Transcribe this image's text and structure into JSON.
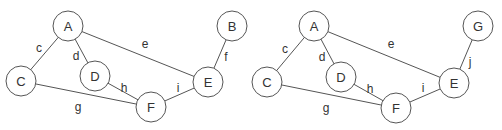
{
  "graphs": [
    {
      "id": "left",
      "nodes": [
        {
          "id": "A",
          "label": "A",
          "x": 68,
          "y": 26
        },
        {
          "id": "B",
          "label": "B",
          "x": 232,
          "y": 26
        },
        {
          "id": "C",
          "label": "C",
          "x": 21,
          "y": 81
        },
        {
          "id": "D",
          "label": "D",
          "x": 95,
          "y": 76
        },
        {
          "id": "E",
          "label": "E",
          "x": 208,
          "y": 82
        },
        {
          "id": "F",
          "label": "F",
          "x": 151,
          "y": 107
        }
      ],
      "edges": [
        {
          "label": "c",
          "from": "A",
          "to": "C",
          "lx": 39,
          "ly": 48
        },
        {
          "label": "d",
          "from": "A",
          "to": "D",
          "lx": 76,
          "ly": 56
        },
        {
          "label": "e",
          "from": "A",
          "to": "E",
          "lx": 145,
          "ly": 44
        },
        {
          "label": "f",
          "from": "B",
          "to": "E",
          "lx": 226,
          "ly": 57
        },
        {
          "label": "g",
          "from": "C",
          "to": "F",
          "lx": 78,
          "ly": 107
        },
        {
          "label": "h",
          "from": "D",
          "to": "F",
          "lx": 124,
          "ly": 88
        },
        {
          "label": "i",
          "from": "F",
          "to": "E",
          "lx": 178,
          "ly": 88
        }
      ]
    },
    {
      "id": "right",
      "nodes": [
        {
          "id": "A",
          "label": "A",
          "x": 314,
          "y": 26
        },
        {
          "id": "G",
          "label": "G",
          "x": 478,
          "y": 26
        },
        {
          "id": "C",
          "label": "C",
          "x": 267,
          "y": 82
        },
        {
          "id": "D",
          "label": "D",
          "x": 341,
          "y": 77
        },
        {
          "id": "E",
          "label": "E",
          "x": 454,
          "y": 83
        },
        {
          "id": "F",
          "label": "F",
          "x": 396,
          "y": 108
        }
      ],
      "edges": [
        {
          "label": "c",
          "from": "A",
          "to": "C",
          "lx": 285,
          "ly": 49
        },
        {
          "label": "d",
          "from": "A",
          "to": "D",
          "lx": 322,
          "ly": 57
        },
        {
          "label": "e",
          "from": "A",
          "to": "E",
          "lx": 391,
          "ly": 44
        },
        {
          "label": "j",
          "from": "G",
          "to": "E",
          "lx": 470,
          "ly": 62
        },
        {
          "label": "g",
          "from": "C",
          "to": "F",
          "lx": 326,
          "ly": 108
        },
        {
          "label": "h",
          "from": "D",
          "to": "F",
          "lx": 370,
          "ly": 89
        },
        {
          "label": "i",
          "from": "F",
          "to": "E",
          "lx": 423,
          "ly": 88
        }
      ]
    }
  ],
  "node_radius": 15
}
